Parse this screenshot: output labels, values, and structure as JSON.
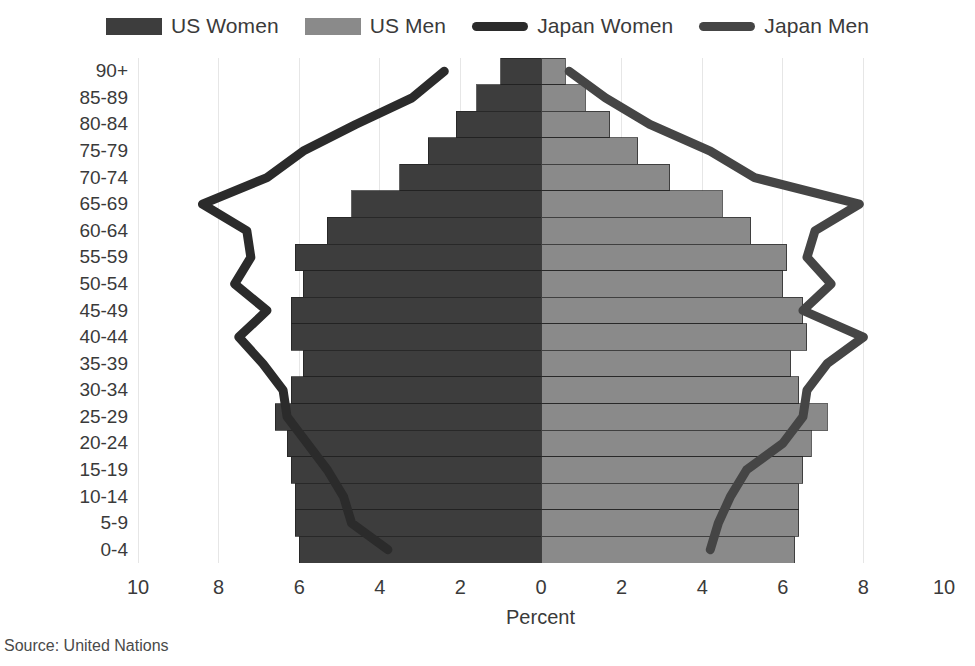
{
  "legend": {
    "items": [
      {
        "label": "US Women",
        "type": "bar",
        "color": "#3d3d3d"
      },
      {
        "label": "US Men",
        "type": "bar",
        "color": "#8a8a8a"
      },
      {
        "label": "Japan Women",
        "type": "line",
        "color": "#2b2b2b"
      },
      {
        "label": "Japan Men",
        "type": "line",
        "color": "#454545"
      }
    ]
  },
  "axes": {
    "x_title": "Percent",
    "x_ticks": [
      "10",
      "8",
      "6",
      "4",
      "2",
      "0",
      "2",
      "4",
      "6",
      "8",
      "10"
    ],
    "x_tick_values": [
      -10,
      -8,
      -6,
      -4,
      -2,
      0,
      2,
      4,
      6,
      8,
      10
    ],
    "x_min": -10,
    "x_max": 10,
    "y_ticks": [
      "90+",
      "85-89",
      "80-84",
      "75-79",
      "70-74",
      "65-69",
      "60-64",
      "55-59",
      "50-54",
      "45-49",
      "40-44",
      "35-39",
      "30-34",
      "25-29",
      "20-24",
      "15-19",
      "10-14",
      "5-9",
      "0-4"
    ],
    "grid": true,
    "grid_color": "#e6e6e6"
  },
  "source": "Source: United Nations",
  "chart_data": {
    "type": "bar",
    "title": "",
    "subtitle": "",
    "xlabel": "Percent",
    "ylabel": "",
    "xlim": [
      -10,
      10
    ],
    "grid": true,
    "legend_position": "top",
    "orientation": "horizontal-diverging",
    "categories": [
      "90+",
      "85-89",
      "80-84",
      "75-79",
      "70-74",
      "65-69",
      "60-64",
      "55-59",
      "50-54",
      "45-49",
      "40-44",
      "35-39",
      "30-34",
      "25-29",
      "20-24",
      "15-19",
      "10-14",
      "5-9",
      "0-4"
    ],
    "series": [
      {
        "name": "US Women",
        "kind": "bar",
        "side": "left",
        "color": "#3d3d3d",
        "values": [
          1.0,
          1.6,
          2.1,
          2.8,
          3.5,
          4.7,
          5.3,
          6.1,
          5.9,
          6.2,
          6.2,
          5.9,
          6.2,
          6.6,
          6.3,
          6.2,
          6.1,
          6.1,
          6.0
        ]
      },
      {
        "name": "US Men",
        "kind": "bar",
        "side": "right",
        "color": "#8a8a8a",
        "values": [
          0.6,
          1.1,
          1.7,
          2.4,
          3.2,
          4.5,
          5.2,
          6.1,
          6.0,
          6.5,
          6.6,
          6.2,
          6.4,
          7.1,
          6.7,
          6.5,
          6.4,
          6.4,
          6.3
        ]
      },
      {
        "name": "Japan Women",
        "kind": "line",
        "side": "left",
        "color": "#2b2b2b",
        "values": [
          2.4,
          3.2,
          4.6,
          5.9,
          6.8,
          8.4,
          7.3,
          7.2,
          7.6,
          6.8,
          7.5,
          6.9,
          6.4,
          6.3,
          5.8,
          5.3,
          4.9,
          4.7,
          3.8
        ]
      },
      {
        "name": "Japan Men",
        "kind": "line",
        "side": "right",
        "color": "#454545",
        "values": [
          0.7,
          1.6,
          2.7,
          4.2,
          5.3,
          7.9,
          6.8,
          6.6,
          7.2,
          6.5,
          8.0,
          7.1,
          6.6,
          6.5,
          6.0,
          5.1,
          4.7,
          4.4,
          4.2
        ]
      }
    ]
  }
}
